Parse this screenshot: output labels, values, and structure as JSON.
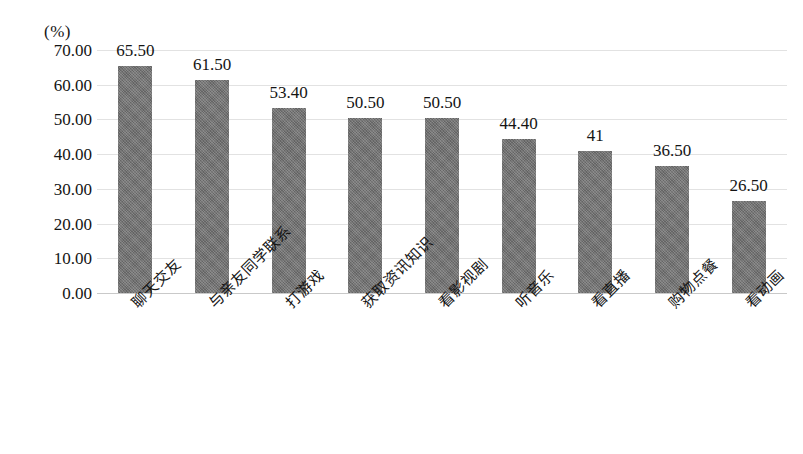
{
  "chart_data": {
    "type": "bar",
    "title": "",
    "xlabel": "",
    "ylabel": "",
    "unit_label": "(%)",
    "ylim": [
      0,
      70
    ],
    "grid": true,
    "legend": "none",
    "orientation": "vertical",
    "bar_color": "#737373",
    "categories": [
      "聊天交友",
      "与亲友同学联系",
      "打游戏",
      "获取资讯知识",
      "看影视剧",
      "听音乐",
      "看直播",
      "购物点餐",
      "看动画"
    ],
    "values": [
      65.5,
      61.5,
      53.4,
      50.5,
      50.5,
      44.4,
      41,
      36.5,
      26.5
    ],
    "value_labels": [
      "65.50",
      "61.50",
      "53.40",
      "50.50",
      "50.50",
      "44.40",
      "41",
      "36.50",
      "26.50"
    ],
    "y_ticks": [
      70,
      60,
      50,
      40,
      30,
      20,
      10,
      0
    ],
    "y_tick_labels": [
      "70.00",
      "60.00",
      "50.00",
      "40.00",
      "30.00",
      "20.00",
      "10.00",
      "0.00"
    ]
  }
}
